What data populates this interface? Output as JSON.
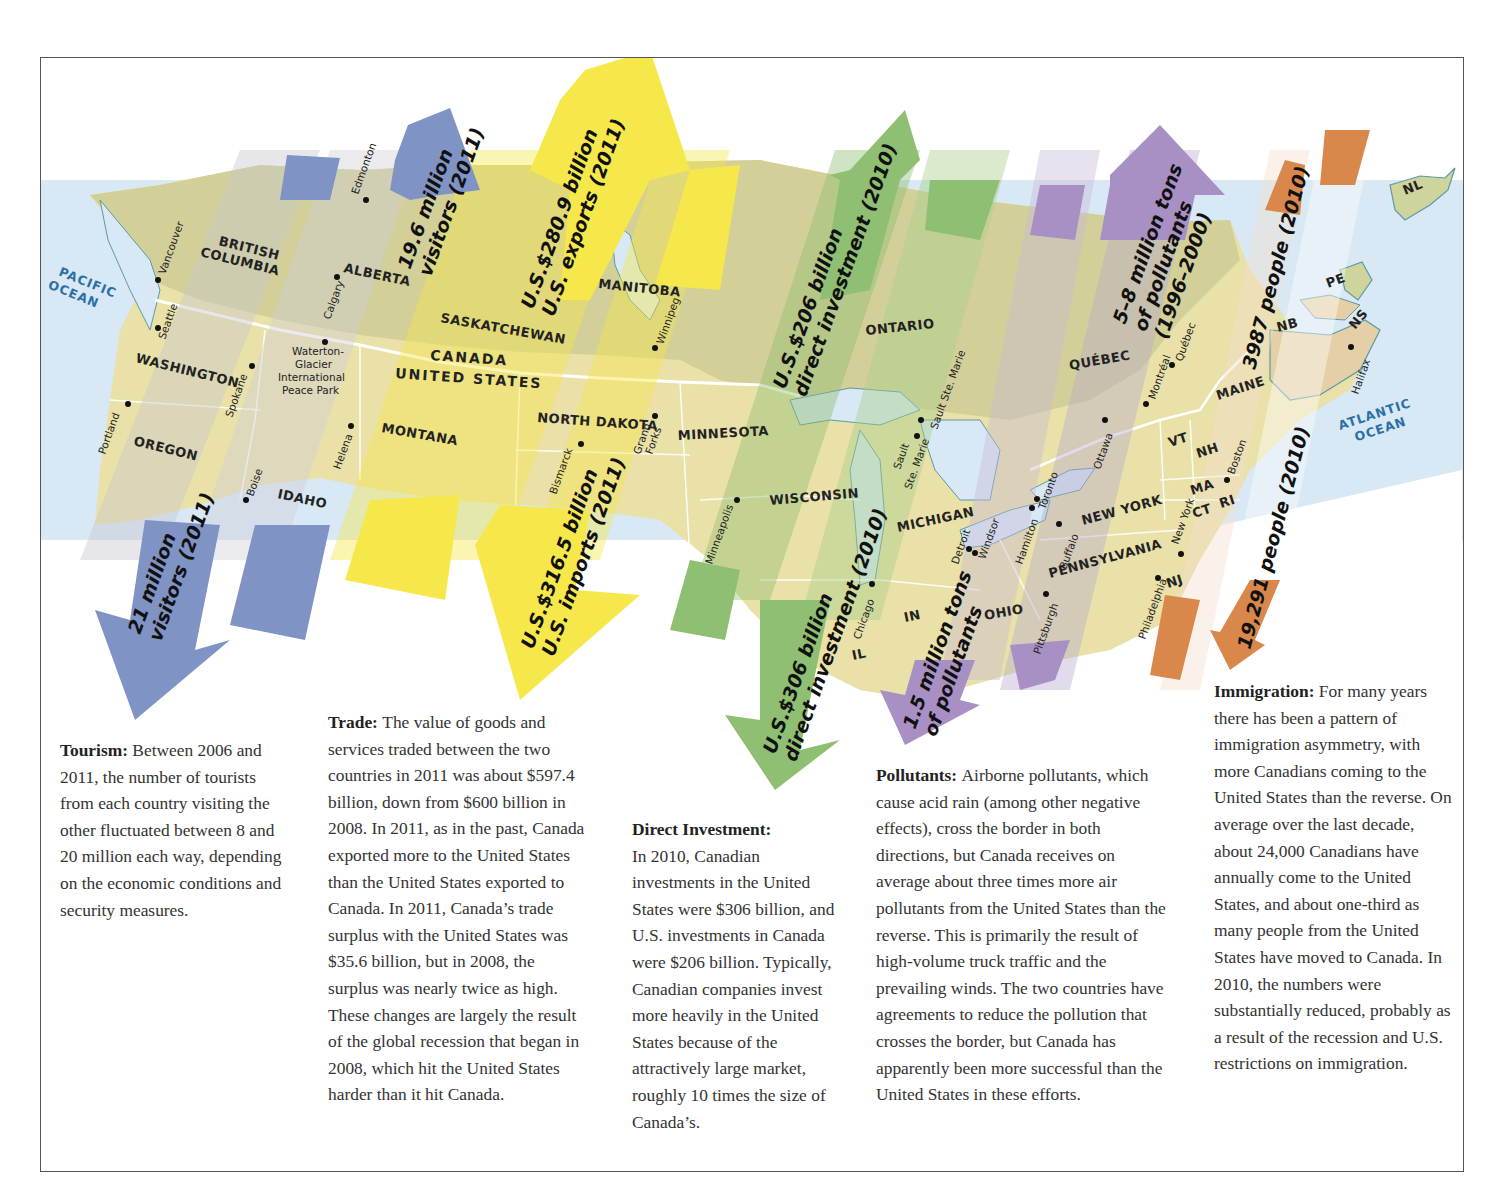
{
  "map": {
    "country_labels": {
      "north": "CANADA",
      "south": "UNITED STATES"
    },
    "oceans": {
      "pacific_1": "PACIFIC",
      "pacific_2": "OCEAN",
      "atlantic_1": "ATLANTIC",
      "atlantic_2": "OCEAN"
    },
    "provinces": {
      "bc_1": "BRITISH",
      "bc_2": "COLUMBIA",
      "alberta": "ALBERTA",
      "saskatchewan": "SASKATCHEWAN",
      "manitoba": "MANITOBA",
      "ontario": "ONTARIO",
      "quebec": "QUÉBEC",
      "nb": "NB",
      "ns": "NS",
      "pe": "PE",
      "nl": "NL"
    },
    "states": {
      "washington": "WASHINGTON",
      "oregon": "OREGON",
      "idaho": "IDAHO",
      "montana": "MONTANA",
      "north_dakota": "NORTH DAKOTA",
      "minnesota": "MINNESOTA",
      "wisconsin": "WISCONSIN",
      "michigan": "MICHIGAN",
      "ohio": "OHIO",
      "in": "IN",
      "il": "IL",
      "new_york": "NEW YORK",
      "pennsylvania": "PENNSYLVANIA",
      "maine": "MAINE",
      "vt": "VT",
      "nh": "NH",
      "ma": "MA",
      "ct": "CT",
      "ri": "RI",
      "nj": "NJ"
    },
    "park": [
      "Waterton-",
      "Glacier",
      "International",
      "Peace Park"
    ],
    "cities": {
      "vancouver": "Vancouver",
      "seattle": "Seattle",
      "edmonton": "Edmonton",
      "calgary": "Calgary",
      "spokane": "Spokane",
      "portland": "Portland",
      "boise": "Boise",
      "helena": "Helena",
      "winnipeg": "Winnipeg",
      "grand_1": "Grand",
      "grand_2": "Forks",
      "bismarck": "Bismarck",
      "minneapolis": "Minneapolis",
      "chicago": "Chicago",
      "sault_us_1": "Sault",
      "sault_us_2": "Ste. Marie",
      "sault_ca": "Sault Ste. Marie",
      "detroit": "Detroit",
      "windsor": "Windsor",
      "hamilton": "Hamilton",
      "toronto": "Toronto",
      "buffalo": "Buffalo",
      "pittsburgh": "Pittsburgh",
      "ottawa": "Ottawa",
      "montreal": "Montréal",
      "quebec_city": "Québec",
      "new_york": "New York",
      "philadelphia": "Philadelphia",
      "boston": "Boston",
      "halifax": "Halifax"
    }
  },
  "arrows": {
    "tourism_north": {
      "line1": "19.6 million",
      "line2": "visitors (2011)",
      "color": "#7f93c4",
      "direction": "north"
    },
    "tourism_south": {
      "line1": "21 million",
      "line2": "visitors (2011)",
      "color": "#7f93c4",
      "direction": "south"
    },
    "trade_north": {
      "line1": "U.S.$280.9 billion",
      "line2": "U.S. exports (2011)",
      "color": "#f6e84a",
      "direction": "north"
    },
    "trade_south": {
      "line1": "U.S.$316.5 billion",
      "line2": "U.S. imports (2011)",
      "color": "#f6e84a",
      "direction": "south"
    },
    "investment_north": {
      "line1": "U.S.$206 billion",
      "line2": "direct investment (2010)",
      "color": "#8fbf72",
      "direction": "north"
    },
    "investment_south": {
      "line1": "U.S.$306 billion",
      "line2": "direct investment (2010)",
      "color": "#8fbf72",
      "direction": "south"
    },
    "pollutants_north": {
      "line1": "5–8 million tons",
      "line2": "of pollutants",
      "line3": "(1996–2000)",
      "color": "#a890c4",
      "direction": "north"
    },
    "pollutants_south": {
      "line1": "1.5 million tons",
      "line2": "of pollutants",
      "color": "#a890c4",
      "direction": "south"
    },
    "immigration_north": {
      "line1": "3987 people (2010)",
      "color": "#d9874a",
      "direction": "north"
    },
    "immigration_south": {
      "line1": "19,291 people (2010)",
      "color": "#d9874a",
      "direction": "south"
    }
  },
  "captions": {
    "tourism": {
      "heading": "Tourism:",
      "body": "Between 2006 and 2011, the number of tourists from each country visiting the other fluctuated between 8 and 20 million each way, depending on the economic conditions and security measures."
    },
    "trade": {
      "heading": "Trade:",
      "body": "The value of goods and services traded between the two countries in 2011 was about $597.4 billion, down from $600 billion in 2008. In 2011, as in the past, Canada exported more to the United States than the United States exported to Canada. In 2011, Canada’s trade surplus with the United States was $35.6 billion, but in 2008, the surplus was nearly twice as high. These changes are largely the result of the global recession that began in 2008, which hit the United States harder than it hit Canada."
    },
    "investment": {
      "heading": "Direct Investment:",
      "body": "In 2010, Canadian investments in the United States were $306 billion, and U.S. investments in Canada were $206 billion. Typically, Canadian companies invest more heavily in the United States because of the attractively large market, roughly 10 times the size of Canada’s."
    },
    "pollutants": {
      "heading": "Pollutants:",
      "body": "Airborne pollutants, which cause acid rain (among other negative effects), cross the border in both directions, but Canada receives on average about three times more air pollutants from the United States than the reverse. This is primarily the result of high-volume truck traffic and the prevailing winds. The two countries have agreements to reduce the pollution that crosses the border, but Canada has apparently been more successful than the United States in these efforts."
    },
    "immigration": {
      "heading": "Immigration:",
      "body": "For many years there has been a pattern of immigration asymmetry, with more Canadians coming to the United States than the reverse. On average over the last decade, about 24,000 Canadians have annually come to the United States, and about one-third as many people from the United States have moved to Canada. In 2010, the numbers were substantially reduced, probably as a result of the recession and U.S. restrictions on immigration."
    }
  },
  "colors": {
    "ocean": "#d8e8f4",
    "land_canada": "#d4d19a",
    "land_us": "#efe9b6",
    "tourism": "#7f93c4",
    "trade": "#f6e84a",
    "investment": "#8fbf72",
    "pollutants": "#a890c4",
    "immigration": "#d9874a"
  }
}
